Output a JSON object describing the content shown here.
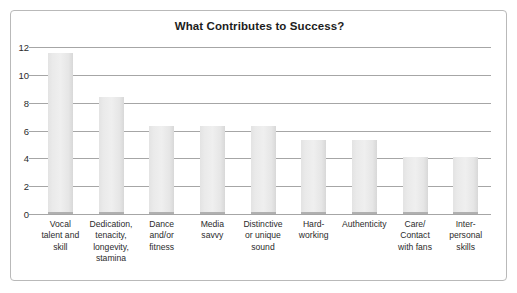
{
  "chart_data": {
    "type": "bar",
    "title": "What Contributes to Success?",
    "xlabel": "",
    "ylabel": "",
    "ylim": [
      0,
      12
    ],
    "yticks": [
      0,
      2,
      4,
      6,
      8,
      10,
      12
    ],
    "grid": true,
    "legend": false,
    "categories": [
      "Vocal talent and skill",
      "Dedication, tenacity, longevity, stamina",
      "Dance and/or fitness",
      "Media savvy",
      "Distinctive or unique sound",
      "Hard-working",
      "Authenticity",
      "Care/ Contact with fans",
      "Inter-personal skills"
    ],
    "category_lines": [
      [
        "Vocal",
        "talent and",
        "skill"
      ],
      [
        "Dedication,",
        "tenacity,",
        "longevity,",
        "stamina"
      ],
      [
        "Dance",
        "and/or",
        "fitness"
      ],
      [
        "Media",
        "savvy"
      ],
      [
        "Distinctive",
        "or unique",
        "sound"
      ],
      [
        "Hard-",
        "working"
      ],
      [
        "Authenticity"
      ],
      [
        "Care/",
        "Contact",
        "with fans"
      ],
      [
        "Inter-",
        "personal",
        "skills"
      ]
    ],
    "values": [
      11.6,
      8.4,
      6.3,
      6.3,
      6.3,
      5.3,
      5.3,
      4.1,
      4.1
    ],
    "bar_color": "#ebebeb",
    "gridline_color": "#a6a6a6",
    "text_color": "#2b2b2b"
  }
}
